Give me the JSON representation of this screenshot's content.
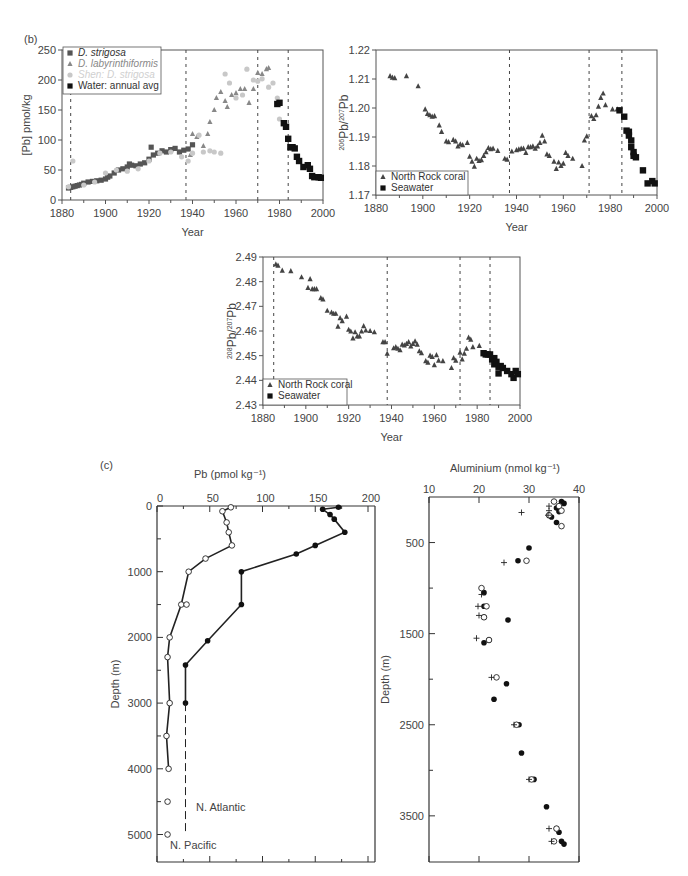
{
  "panel_labels": {
    "b": "(b)",
    "c": "(c)"
  },
  "chart_data": [
    {
      "id": "pb-concentration",
      "type": "scatter",
      "title": "",
      "xlabel": "Year",
      "ylabel": "[Pb] pmol/kg",
      "xlim": [
        1880,
        2000
      ],
      "ylim": [
        0,
        250
      ],
      "xticks": [
        1880,
        1900,
        1920,
        1940,
        1960,
        1980,
        2000
      ],
      "yticks": [
        0,
        50,
        100,
        150,
        200,
        250
      ],
      "vlines": [
        1884,
        1937,
        1970,
        1984
      ],
      "legend_position": "upper-left",
      "series": [
        {
          "name": "D. strigosa",
          "marker": "square",
          "color": "#555555",
          "x": [
            1883,
            1884,
            1885,
            1886,
            1887,
            1888,
            1889,
            1890,
            1892,
            1894,
            1896,
            1898,
            1900,
            1901,
            1902,
            1904,
            1906,
            1908,
            1910,
            1911,
            1912,
            1914,
            1916,
            1918,
            1920,
            1921,
            1922,
            1924,
            1926,
            1928,
            1930,
            1932,
            1934,
            1936,
            1938,
            1940
          ],
          "y": [
            20,
            21,
            22,
            23,
            24,
            25,
            26,
            28,
            30,
            31,
            32,
            33,
            35,
            38,
            40,
            45,
            50,
            52,
            55,
            60,
            58,
            57,
            60,
            62,
            68,
            88,
            75,
            78,
            82,
            80,
            84,
            86,
            80,
            83,
            85,
            92
          ]
        },
        {
          "name": "D. labyrinthiformis",
          "marker": "triangle",
          "color": "#888888",
          "x": [
            1939,
            1940,
            1942,
            1945,
            1947,
            1948,
            1950,
            1951,
            1953,
            1955,
            1956,
            1958,
            1960,
            1962,
            1964,
            1966,
            1968,
            1970,
            1972,
            1974,
            1975
          ],
          "y": [
            75,
            110,
            105,
            90,
            110,
            130,
            150,
            170,
            180,
            165,
            155,
            175,
            178,
            185,
            185,
            162,
            185,
            212,
            210,
            218,
            220
          ]
        },
        {
          "name": "Shen: D. strigosa",
          "marker": "circle",
          "color": "#c8c8c8",
          "x": [
            1883,
            1885,
            1890,
            1895,
            1900,
            1905,
            1910,
            1915,
            1920,
            1925,
            1930,
            1935,
            1938,
            1940,
            1943,
            1945,
            1948,
            1950,
            1953,
            1955,
            1957,
            1960,
            1963,
            1965,
            1968,
            1970,
            1972,
            1975,
            1977,
            1979,
            1980
          ],
          "y": [
            22,
            65,
            25,
            30,
            45,
            50,
            48,
            52,
            65,
            78,
            80,
            72,
            65,
            78,
            108,
            80,
            82,
            80,
            78,
            210,
            195,
            170,
            175,
            218,
            200,
            198,
            202,
            188,
            195,
            170,
            135
          ]
        },
        {
          "name": "Water: annual avg",
          "marker": "square",
          "color": "#111111",
          "x": [
            1979,
            1980,
            1982,
            1983,
            1984,
            1985,
            1986,
            1987,
            1988,
            1989,
            1991,
            1993,
            1994,
            1995,
            1996,
            1998,
            1999
          ],
          "y": [
            160,
            162,
            128,
            122,
            102,
            88,
            88,
            86,
            72,
            65,
            55,
            58,
            52,
            40,
            38,
            38,
            37
          ]
        }
      ]
    },
    {
      "id": "pb206-207",
      "type": "scatter",
      "xlabel": "Year",
      "ylabel": "206Pb/207Pb",
      "xlim": [
        1880,
        2000
      ],
      "ylim": [
        1.17,
        1.22
      ],
      "xticks": [
        1880,
        1900,
        1920,
        1940,
        1960,
        1980,
        2000
      ],
      "yticks": [
        1.17,
        1.18,
        1.19,
        1.2,
        1.21,
        1.22
      ],
      "vlines": [
        1937,
        1971,
        1985
      ],
      "legend_position": "lower-left",
      "series": [
        {
          "name": "North Rock coral",
          "marker": "triangle",
          "color": "#444444",
          "x": [
            1886,
            1887,
            1888,
            1893,
            1898,
            1901,
            1902,
            1903,
            1904,
            1905,
            1907,
            1908,
            1910,
            1911,
            1913,
            1914,
            1915,
            1916,
            1917,
            1919,
            1920,
            1921,
            1922,
            1923,
            1924,
            1925,
            1926,
            1927,
            1928,
            1929,
            1930,
            1932,
            1935,
            1936,
            1938,
            1940,
            1941,
            1942,
            1943,
            1944,
            1945,
            1946,
            1947,
            1948,
            1949,
            1950,
            1951,
            1952,
            1953,
            1954,
            1956,
            1957,
            1958,
            1959,
            1960,
            1961,
            1962,
            1964,
            1968,
            1969,
            1970,
            1972,
            1973,
            1974,
            1975,
            1976,
            1977,
            1978,
            1981,
            1983
          ],
          "y": [
            1.211,
            1.2105,
            1.2103,
            1.211,
            1.2075,
            1.1995,
            1.198,
            1.1975,
            1.197,
            1.1972,
            1.194,
            1.1918,
            1.1885,
            1.1882,
            1.189,
            1.1885,
            1.1868,
            1.1875,
            1.1872,
            1.188,
            1.1832,
            1.1815,
            1.1798,
            1.1825,
            1.1818,
            1.182,
            1.1835,
            1.1848,
            1.1862,
            1.1858,
            1.186,
            1.1852,
            1.1825,
            1.1822,
            1.185,
            1.1855,
            1.1857,
            1.186,
            1.186,
            1.1845,
            1.1865,
            1.1865,
            1.1868,
            1.186,
            1.1868,
            1.188,
            1.1905,
            1.1885,
            1.184,
            1.1835,
            1.1815,
            1.179,
            1.1812,
            1.18,
            1.1808,
            1.1845,
            1.1835,
            1.1825,
            1.18,
            1.1888,
            1.1902,
            1.1972,
            1.1962,
            1.1975,
            1.2005,
            1.2035,
            1.205,
            1.201,
            1.1995,
            1.1995
          ]
        },
        {
          "name": "Seawater",
          "marker": "square",
          "color": "#111111",
          "x": [
            1984,
            1986,
            1987,
            1988,
            1988,
            1989,
            1989,
            1990,
            1990,
            1991,
            1994,
            1996,
            1998,
            1999
          ],
          "y": [
            1.1992,
            1.197,
            1.1922,
            1.1918,
            1.1905,
            1.1888,
            1.1865,
            1.1848,
            1.1835,
            1.183,
            1.1785,
            1.174,
            1.1748,
            1.174
          ]
        }
      ]
    },
    {
      "id": "pb208-207",
      "type": "scatter",
      "xlabel": "Year",
      "ylabel": "208Pb/207Pb",
      "xlim": [
        1880,
        2000
      ],
      "ylim": [
        2.43,
        2.49
      ],
      "xticks": [
        1880,
        1900,
        1920,
        1940,
        1960,
        1980,
        2000
      ],
      "yticks": [
        2.43,
        2.44,
        2.45,
        2.46,
        2.47,
        2.48,
        2.49
      ],
      "vlines": [
        1885,
        1938,
        1972,
        1986
      ],
      "legend_position": "lower-left",
      "series": [
        {
          "name": "North Rock coral",
          "marker": "triangle",
          "color": "#444444",
          "x": [
            1886,
            1887,
            1889,
            1893,
            1898,
            1901,
            1902,
            1903,
            1904,
            1905,
            1907,
            1908,
            1910,
            1912,
            1913,
            1914,
            1915,
            1916,
            1917,
            1919,
            1920,
            1921,
            1922,
            1923,
            1924,
            1925,
            1926,
            1927,
            1928,
            1930,
            1932,
            1936,
            1937,
            1938,
            1941,
            1942,
            1943,
            1944,
            1945,
            1946,
            1947,
            1948,
            1949,
            1950,
            1951,
            1952,
            1953,
            1954,
            1956,
            1957,
            1958,
            1959,
            1960,
            1961,
            1962,
            1964,
            1968,
            1969,
            1970,
            1972,
            1973,
            1974,
            1975,
            1976,
            1977,
            1978,
            1981
          ],
          "y": [
            2.487,
            2.4865,
            2.4845,
            2.4843,
            2.4818,
            2.4775,
            2.481,
            2.477,
            2.477,
            2.477,
            2.4733,
            2.4728,
            2.4682,
            2.4675,
            2.467,
            2.467,
            2.4618,
            2.4652,
            2.464,
            2.4658,
            2.4605,
            2.4598,
            2.457,
            2.4595,
            2.4578,
            2.4578,
            2.4598,
            2.462,
            2.4602,
            2.46,
            2.4595,
            2.4555,
            2.4555,
            2.4508,
            2.453,
            2.4535,
            2.4528,
            2.4522,
            2.4545,
            2.4542,
            2.4548,
            2.4555,
            2.4538,
            2.4548,
            2.4558,
            2.4545,
            2.4518,
            2.451,
            2.4478,
            2.4472,
            2.45,
            2.4495,
            2.4462,
            2.4502,
            2.448,
            2.4478,
            2.445,
            2.449,
            2.448,
            2.4512,
            2.4485,
            2.4508,
            2.4528,
            2.4573,
            2.4565,
            2.4535,
            2.454
          ]
        },
        {
          "name": "Seawater",
          "marker": "square",
          "color": "#111111",
          "x": [
            1983,
            1984,
            1985,
            1986,
            1987,
            1988,
            1988,
            1989,
            1990,
            1990,
            1991,
            1992,
            1994,
            1996,
            1997,
            1998,
            1999
          ],
          "y": [
            2.451,
            2.4505,
            2.4505,
            2.4505,
            2.4485,
            2.4465,
            2.449,
            2.4475,
            2.4455,
            2.4428,
            2.4458,
            2.445,
            2.4438,
            2.4425,
            2.441,
            2.4438,
            2.4425
          ]
        }
      ]
    },
    {
      "id": "pb-depth-profile",
      "type": "line",
      "xlabel": "Pb (pmol kg⁻¹)",
      "ylabel": "Depth (m)",
      "xlim": [
        0,
        200
      ],
      "ylim": [
        5400,
        0
      ],
      "xticks": [
        0,
        50,
        100,
        150,
        200
      ],
      "yticks": [
        0,
        1000,
        2000,
        3000,
        4000,
        5000
      ],
      "x_axis_position": "top",
      "annotations": [
        "N. Atlantic",
        "N. Pacific"
      ],
      "series": [
        {
          "name": "N. Pacific",
          "marker": "open-circle",
          "connected": true,
          "x": [
            70,
            62,
            66,
            68,
            71,
            46,
            30,
            23,
            12,
            10,
            12,
            9,
            11
          ],
          "y": [
            20,
            80,
            250,
            400,
            600,
            800,
            1000,
            1500,
            2000,
            2300,
            3000,
            3500,
            4000
          ]
        },
        {
          "name": "N. Pacific (unconnected)",
          "marker": "open-circle",
          "connected": false,
          "x": [
            28,
            10,
            10
          ],
          "y": [
            1500,
            4500,
            5000
          ]
        },
        {
          "name": "N. Atlantic",
          "marker": "filled-circle",
          "connected": true,
          "x": [
            172,
            157,
            164,
            168,
            178,
            150,
            132,
            80,
            80,
            48,
            27,
            27
          ],
          "y": [
            20,
            50,
            130,
            200,
            400,
            600,
            730,
            1000,
            1500,
            2050,
            2420,
            3000
          ]
        },
        {
          "name": "N. Atlantic (extrapolated)",
          "marker": "none",
          "line": "dashed",
          "x": [
            27,
            27
          ],
          "y": [
            3000,
            5000
          ]
        }
      ]
    },
    {
      "id": "aluminium-depth-profile",
      "type": "scatter",
      "xlabel": "Aluminium (nmol kg⁻¹)",
      "ylabel": "Depth (m)",
      "xlim": [
        10,
        40
      ],
      "ylim": [
        4000,
        0
      ],
      "xticks": [
        10,
        20,
        30,
        40
      ],
      "yticks": [
        500,
        1500,
        2500,
        3500
      ],
      "x_axis_position": "top",
      "series": [
        {
          "name": "filled",
          "marker": "filled-circle",
          "x": [
            36.5,
            37,
            35.5,
            36,
            34.5,
            35.5,
            30,
            27.8,
            21,
            21,
            21,
            25.8,
            22,
            21,
            25.5,
            23,
            28,
            28.5,
            31,
            33.5,
            35.5,
            36,
            36.5,
            37
          ],
          "y": [
            50,
            70,
            120,
            160,
            220,
            280,
            560,
            700,
            1050,
            1200,
            1320,
            1350,
            1570,
            1600,
            2050,
            2220,
            2500,
            2810,
            3100,
            3400,
            3640,
            3680,
            3780,
            3810
          ]
        },
        {
          "name": "open",
          "marker": "open-circle",
          "x": [
            35,
            36,
            36.5,
            34,
            36.5,
            29.5,
            20.5,
            21.5,
            21,
            22,
            23.5,
            27.5,
            30.5,
            35.5,
            35
          ],
          "y": [
            50,
            100,
            150,
            200,
            320,
            700,
            1000,
            1200,
            1320,
            1570,
            1980,
            2500,
            3100,
            3640,
            3780
          ]
        },
        {
          "name": "plus",
          "marker": "plus",
          "x": [
            34,
            34,
            33.8,
            28.5,
            25,
            20.5,
            19.8,
            20,
            19.5,
            22.5,
            27,
            30,
            34,
            34.5
          ],
          "y": [
            100,
            150,
            200,
            170,
            720,
            1070,
            1200,
            1300,
            1550,
            1980,
            2500,
            3100,
            3640,
            3780
          ]
        }
      ]
    }
  ]
}
